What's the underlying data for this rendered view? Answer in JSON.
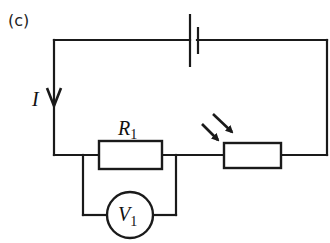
{
  "diagram": {
    "panel_label": "(c)",
    "type": "circuit",
    "colors": {
      "line": "#1a1a1a",
      "background": "#ffffff"
    },
    "current": {
      "symbol": "I",
      "direction": "down"
    },
    "components": [
      {
        "id": "cell",
        "type": "battery",
        "position": "top wire"
      },
      {
        "id": "R1",
        "type": "resistor",
        "label": "R",
        "subscript": "1",
        "position": "bottom wire, left"
      },
      {
        "id": "V1",
        "type": "voltmeter",
        "label": "V",
        "subscript": "1",
        "connection": "parallel to R1"
      },
      {
        "id": "LDR",
        "type": "light-dependent resistor",
        "position": "bottom wire, right",
        "light_arrows": 2
      }
    ]
  }
}
